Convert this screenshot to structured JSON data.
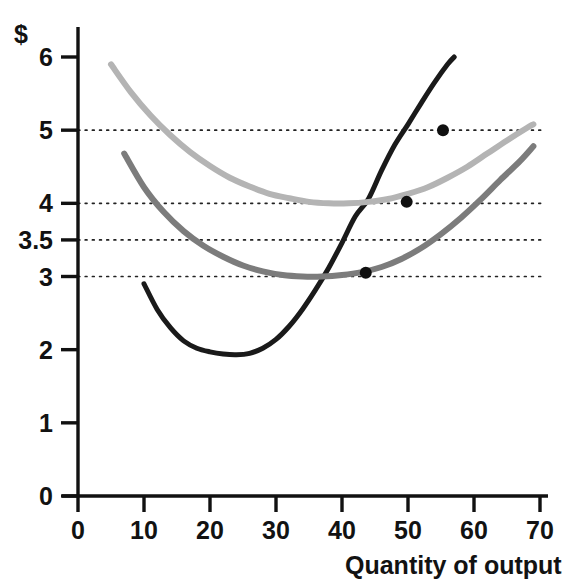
{
  "chart_data": {
    "type": "line",
    "title": "",
    "xlabel": "Quantity of output",
    "ylabel": "$",
    "xlim": [
      0,
      70
    ],
    "ylim": [
      0,
      6.3
    ],
    "xticks": [
      0,
      10,
      20,
      30,
      40,
      50,
      60,
      70
    ],
    "xtick_labels": [
      "0",
      "10",
      "20",
      "30",
      "40",
      "50",
      "60",
      "70"
    ],
    "yticks": [
      0,
      1,
      2,
      3,
      3.5,
      4,
      5,
      6
    ],
    "ytick_labels": [
      "0",
      "1",
      "2",
      "3",
      "3.5",
      "4",
      "5",
      "6"
    ],
    "grid": "horizontal-dotted",
    "gridlines_at": [
      3,
      3.5,
      4,
      5
    ],
    "legend": "none",
    "series": [
      {
        "name": "marginal-cost",
        "color": "#1a1a1a",
        "width": 5,
        "points": [
          [
            10,
            2.9
          ],
          [
            12,
            2.55
          ],
          [
            14,
            2.3
          ],
          [
            16,
            2.12
          ],
          [
            18,
            2.02
          ],
          [
            20,
            1.97
          ],
          [
            22,
            1.94
          ],
          [
            24,
            1.93
          ],
          [
            26,
            1.95
          ],
          [
            28,
            2.02
          ],
          [
            30,
            2.14
          ],
          [
            32,
            2.32
          ],
          [
            34,
            2.55
          ],
          [
            36,
            2.82
          ],
          [
            38,
            3.12
          ],
          [
            40,
            3.46
          ],
          [
            42,
            3.82
          ],
          [
            44,
            4.06
          ],
          [
            46,
            4.45
          ],
          [
            48,
            4.8
          ],
          [
            50,
            5.08
          ],
          [
            52,
            5.37
          ],
          [
            54,
            5.65
          ],
          [
            56,
            5.9
          ],
          [
            57,
            6.0
          ]
        ]
      },
      {
        "name": "average-variable-cost",
        "color": "#7c7c7c",
        "width": 6,
        "points": [
          [
            7,
            4.68
          ],
          [
            10,
            4.22
          ],
          [
            13,
            3.88
          ],
          [
            16,
            3.62
          ],
          [
            19,
            3.42
          ],
          [
            22,
            3.27
          ],
          [
            25,
            3.15
          ],
          [
            28,
            3.07
          ],
          [
            31,
            3.02
          ],
          [
            34,
            3.0
          ],
          [
            37,
            3.0
          ],
          [
            40,
            3.02
          ],
          [
            43,
            3.06
          ],
          [
            46,
            3.13
          ],
          [
            49,
            3.24
          ],
          [
            52,
            3.39
          ],
          [
            55,
            3.58
          ],
          [
            58,
            3.8
          ],
          [
            61,
            4.05
          ],
          [
            64,
            4.32
          ],
          [
            67,
            4.58
          ],
          [
            69,
            4.78
          ]
        ]
      },
      {
        "name": "average-total-cost",
        "color": "#b4b4b4",
        "width": 6,
        "points": [
          [
            5,
            5.9
          ],
          [
            8,
            5.52
          ],
          [
            11,
            5.2
          ],
          [
            14,
            4.93
          ],
          [
            17,
            4.7
          ],
          [
            20,
            4.51
          ],
          [
            23,
            4.35
          ],
          [
            26,
            4.23
          ],
          [
            29,
            4.13
          ],
          [
            32,
            4.07
          ],
          [
            35,
            4.02
          ],
          [
            38,
            4.0
          ],
          [
            41,
            4.0
          ],
          [
            44,
            4.02
          ],
          [
            47,
            4.06
          ],
          [
            50,
            4.13
          ],
          [
            53,
            4.22
          ],
          [
            56,
            4.35
          ],
          [
            59,
            4.5
          ],
          [
            62,
            4.68
          ],
          [
            65,
            4.86
          ],
          [
            68,
            5.03
          ],
          [
            69,
            5.08
          ]
        ]
      }
    ],
    "marked_points": [
      {
        "name": "mc-equals-atc-upper",
        "x": 55.3,
        "y": 5.0,
        "color": "#101010",
        "r": 6
      },
      {
        "name": "mc-crosses-atc-minimum",
        "x": 49.8,
        "y": 4.02,
        "color": "#101010",
        "r": 6
      },
      {
        "name": "mc-crosses-avc-minimum",
        "x": 43.6,
        "y": 3.05,
        "color": "#101010",
        "r": 6
      }
    ]
  },
  "axes": {
    "currency_symbol": "$",
    "x_axis_title": "Quantity of output"
  }
}
